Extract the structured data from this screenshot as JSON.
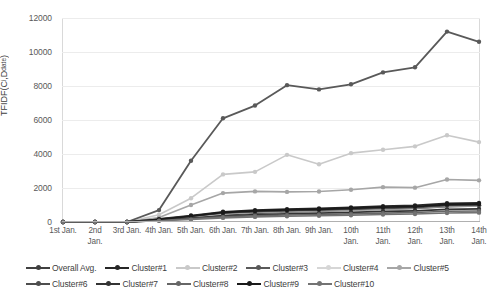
{
  "chart_data": {
    "type": "line",
    "title": "",
    "xlabel": "",
    "ylabel": "TFIDF(Ci,Ddate)",
    "ylabel_main": "TFIDF(C",
    "ylabel_sub1": "i",
    "ylabel_mid": ",D",
    "ylabel_sub2": "date",
    "ylabel_end": ")",
    "ylim": [
      0,
      12000
    ],
    "ytick_step": 2000,
    "yticks": [
      0,
      2000,
      4000,
      6000,
      8000,
      10000,
      12000
    ],
    "ytick_labels": [
      "0",
      "2000",
      "4000",
      "6000",
      "8000",
      "10000",
      "12000"
    ],
    "grid": true,
    "legend_position": "bottom",
    "categories": [
      "1st Jan.",
      "2nd\nJan.",
      "3rd Jan.",
      "4th Jan.",
      "5th Jan.",
      "6th Jan.",
      "7th Jan.",
      "8th Jan.",
      "9th Jan.",
      "10th\nJan.",
      "11th\nJan.",
      "12th\nJan.",
      "13th\nJan.",
      "14th\nJan."
    ],
    "series": [
      {
        "name": "Overall Avg.",
        "color": "#404040",
        "width": 1.6,
        "values": [
          0,
          0,
          0,
          120,
          260,
          420,
          520,
          590,
          640,
          700,
          760,
          800,
          900,
          950
        ]
      },
      {
        "name": "Cluster#1",
        "color": "#262626",
        "width": 1.8,
        "values": [
          0,
          0,
          0,
          180,
          380,
          600,
          700,
          760,
          800,
          860,
          930,
          980,
          1100,
          1120
        ]
      },
      {
        "name": "Cluster#2",
        "color": "#c9c9c9",
        "width": 1.6,
        "values": [
          0,
          0,
          0,
          430,
          1400,
          2800,
          2950,
          3950,
          3400,
          4050,
          4250,
          4450,
          5100,
          4700
        ]
      },
      {
        "name": "Cluster#3",
        "color": "#595959",
        "width": 1.8,
        "values": [
          0,
          0,
          0,
          700,
          3600,
          6100,
          6850,
          8050,
          7800,
          8100,
          8800,
          9100,
          11200,
          10600
        ]
      },
      {
        "name": "Cluster#4",
        "color": "#d6d6d6",
        "width": 1.5,
        "values": [
          0,
          0,
          0,
          120,
          300,
          470,
          560,
          620,
          660,
          710,
          770,
          820,
          930,
          960
        ]
      },
      {
        "name": "Cluster#5",
        "color": "#a6a6a6",
        "width": 1.6,
        "values": [
          0,
          0,
          0,
          260,
          1000,
          1700,
          1800,
          1770,
          1790,
          1900,
          2050,
          2020,
          2500,
          2450
        ]
      },
      {
        "name": "Cluster#6",
        "color": "#4d4d4d",
        "width": 1.8,
        "values": [
          0,
          0,
          0,
          150,
          330,
          520,
          600,
          660,
          700,
          750,
          810,
          850,
          960,
          990
        ]
      },
      {
        "name": "Cluster#7",
        "color": "#333333",
        "width": 1.8,
        "values": [
          0,
          0,
          0,
          100,
          220,
          350,
          430,
          480,
          520,
          570,
          620,
          660,
          740,
          770
        ]
      },
      {
        "name": "Cluster#8",
        "color": "#666666",
        "width": 1.6,
        "values": [
          0,
          0,
          0,
          90,
          190,
          300,
          370,
          410,
          440,
          480,
          520,
          560,
          630,
          650
        ]
      },
      {
        "name": "Cluster#9",
        "color": "#1a1a1a",
        "width": 1.8,
        "values": [
          0,
          0,
          0,
          160,
          350,
          560,
          650,
          710,
          750,
          810,
          870,
          910,
          1030,
          1060
        ]
      },
      {
        "name": "Cluster#10",
        "color": "#737373",
        "width": 1.6,
        "values": [
          0,
          0,
          0,
          70,
          150,
          240,
          300,
          340,
          370,
          400,
          440,
          470,
          530,
          550
        ]
      }
    ]
  }
}
